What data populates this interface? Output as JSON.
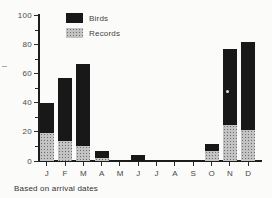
{
  "figure": {
    "background_color": "#fbfbfa",
    "axis_color": "#1d1d1d",
    "text_color": "#474747"
  },
  "legend": {
    "position": "top-left-inside",
    "birds_label": "Birds",
    "records_label": "Records"
  },
  "chart_data": {
    "type": "bar",
    "stacked": true,
    "title": "",
    "xlabel": "",
    "ylabel": "",
    "caption": "Based on arrival dates",
    "categories": [
      "J",
      "F",
      "M",
      "A",
      "M",
      "J",
      "J",
      "A",
      "S",
      "O",
      "N",
      "D"
    ],
    "series": [
      {
        "name": "Records",
        "color": "#c3c3c3",
        "pattern": "halftone-dots",
        "values": [
          19,
          14,
          10,
          2,
          0,
          0,
          0,
          0,
          0,
          7,
          25,
          21
        ]
      },
      {
        "name": "Birds",
        "color": "#181818",
        "pattern": "solid",
        "values": [
          21,
          43,
          57,
          5,
          0,
          4,
          0,
          0,
          0,
          5,
          52,
          61
        ]
      }
    ],
    "totals": [
      40,
      57,
      67,
      7,
      0,
      4,
      0,
      0,
      0,
      12,
      77,
      82
    ],
    "ylim": [
      0,
      100
    ],
    "y_major_ticks": [
      0,
      20,
      40,
      60,
      80,
      100
    ],
    "y_minor_step": 10,
    "grid": false,
    "legend_position": "top-left-inside"
  }
}
